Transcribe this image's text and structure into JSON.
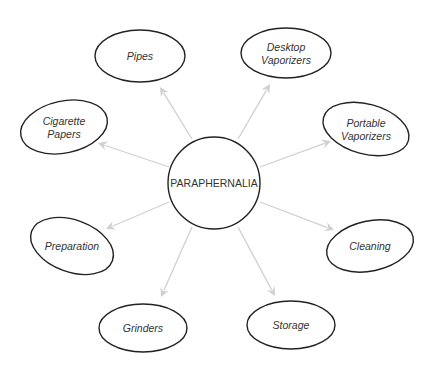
{
  "diagram": {
    "type": "hub-and-spoke",
    "colors": {
      "node_stroke": "#222222",
      "arrow": "#d0d0d0",
      "text": "#333333",
      "background": "#ffffff"
    },
    "center": {
      "label": "PARAPHERNALIA",
      "cx": 214,
      "cy": 183,
      "r": 46
    },
    "nodes": [
      {
        "id": "pipes",
        "lines": [
          "Pipes"
        ],
        "cx": 140,
        "cy": 56,
        "rx": 45,
        "ry": 26,
        "rot": 0
      },
      {
        "id": "desktop-vaporizers",
        "lines": [
          "Desktop",
          "Vaporizers"
        ],
        "cx": 286,
        "cy": 53,
        "rx": 45,
        "ry": 25,
        "rot": 0
      },
      {
        "id": "portable-vaporizers",
        "lines": [
          "Portable",
          "Vaporizers"
        ],
        "cx": 366,
        "cy": 129,
        "rx": 44,
        "ry": 25,
        "rot": 15
      },
      {
        "id": "cigarette-papers",
        "lines": [
          "Cigarette",
          "Papers"
        ],
        "cx": 64,
        "cy": 127,
        "rx": 44,
        "ry": 26,
        "rot": -12
      },
      {
        "id": "preparation",
        "lines": [
          "Preparation"
        ],
        "cx": 72,
        "cy": 246,
        "rx": 43,
        "ry": 26,
        "rot": 20
      },
      {
        "id": "cleaning",
        "lines": [
          "Cleaning"
        ],
        "cx": 370,
        "cy": 246,
        "rx": 44,
        "ry": 25,
        "rot": -12
      },
      {
        "id": "grinders",
        "lines": [
          "Grinders"
        ],
        "cx": 143,
        "cy": 328,
        "rx": 44,
        "ry": 24,
        "rot": 0
      },
      {
        "id": "storage",
        "lines": [
          "Storage"
        ],
        "cx": 291,
        "cy": 325,
        "rx": 44,
        "ry": 24,
        "rot": 0
      }
    ],
    "edges": [
      {
        "from": "center",
        "to": "pipes",
        "x1": 192,
        "y1": 139,
        "x2": 160,
        "y2": 87
      },
      {
        "from": "center",
        "to": "desktop-vaporizers",
        "x1": 238,
        "y1": 139,
        "x2": 270,
        "y2": 84
      },
      {
        "from": "center",
        "to": "portable-vaporizers",
        "x1": 260,
        "y1": 167,
        "x2": 331,
        "y2": 141
      },
      {
        "from": "center",
        "to": "cigarette-papers",
        "x1": 169,
        "y1": 167,
        "x2": 98,
        "y2": 143
      },
      {
        "from": "center",
        "to": "preparation",
        "x1": 169,
        "y1": 202,
        "x2": 106,
        "y2": 229
      },
      {
        "from": "center",
        "to": "cleaning",
        "x1": 260,
        "y1": 202,
        "x2": 334,
        "y2": 230
      },
      {
        "from": "center",
        "to": "grinders",
        "x1": 192,
        "y1": 227,
        "x2": 161,
        "y2": 297
      },
      {
        "from": "center",
        "to": "storage",
        "x1": 238,
        "y1": 227,
        "x2": 275,
        "y2": 296
      }
    ]
  }
}
